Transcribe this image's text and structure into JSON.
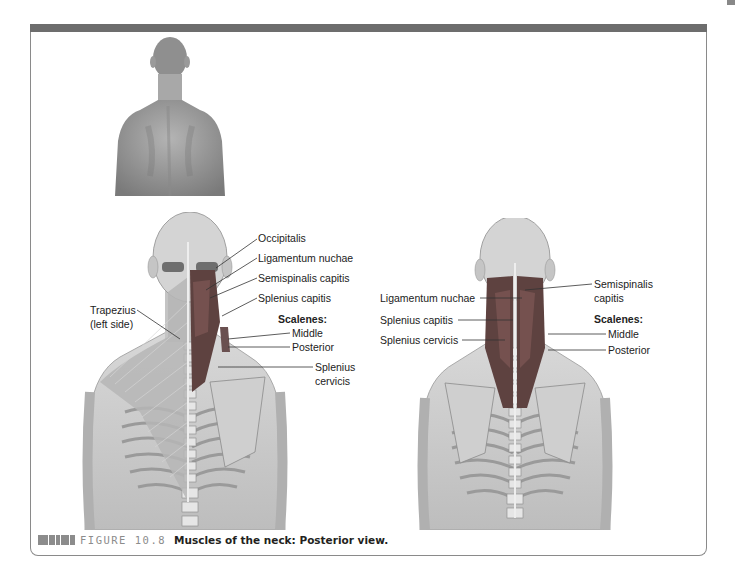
{
  "figure": {
    "label": "FIGURE 10.8",
    "title": "Muscles of the neck: Posterior view.",
    "colors": {
      "top_bar": "#6d6d6d",
      "frame_border": "#8a8a8a",
      "caption_label": "#8c8c8c",
      "muscle": "#6e4a48",
      "skin": "#c8c8c8"
    }
  },
  "thumbnail": {
    "description": "Photo of a man's back, posterior view (head, neck, shoulders)"
  },
  "left_illustration": {
    "labels": {
      "occipitalis": "Occipitalis",
      "ligamentum_nuchae": "Ligamentum nuchae",
      "semispinalis_capitis": "Semispinalis capitis",
      "splenius_capitis": "Splenius capitis",
      "scalenes_heading": "Scalenes:",
      "scalenes_middle": "Middle",
      "scalenes_posterior": "Posterior",
      "splenius_cervicis_1": "Splenius",
      "splenius_cervicis_2": "cervicis",
      "trapezius_1": "Trapezius",
      "trapezius_2": "(left side)"
    }
  },
  "right_illustration": {
    "labels": {
      "ligamentum_nuchae": "Ligamentum nuchae",
      "splenius_capitis": "Splenius capitis",
      "splenius_cervicis": "Splenius cervicis",
      "semispinalis_capitis_1": "Semispinalis",
      "semispinalis_capitis_2": "capitis",
      "scalenes_heading": "Scalenes:",
      "scalenes_middle": "Middle",
      "scalenes_posterior": "Posterior"
    }
  }
}
